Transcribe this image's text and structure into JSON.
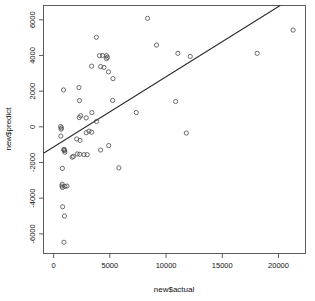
{
  "chart_data": {
    "type": "scatter",
    "title": "",
    "xlabel": "new$actual",
    "ylabel": "new$predict",
    "xlim": [
      -900,
      22400
    ],
    "ylim": [
      -7100,
      6800
    ],
    "grid": false,
    "legend": "none",
    "xticks": [
      0,
      5000,
      10000,
      15000,
      20000
    ],
    "xtick_labels": [
      "0",
      "5000",
      "10000",
      "15000",
      "20000"
    ],
    "yticks": [
      -6000,
      -4000,
      -2000,
      0,
      2000,
      4000,
      6000
    ],
    "ytick_labels": [
      "-6000",
      "-4000",
      "-2000",
      "0",
      "2000",
      "4000",
      "6000"
    ],
    "marker": "open-circle",
    "marker_size": 2.1,
    "point_color": "#4a4a4a",
    "line_color": "#2b2b2b",
    "fit_line": {
      "type": "linear-regression",
      "x_start": -900,
      "y_start": -1480,
      "x_end": 20150,
      "y_end": 6800,
      "slope": 0.3933,
      "intercept": -1126
    },
    "points": [
      {
        "x": 8350,
        "y": 6080
      },
      {
        "x": 21300,
        "y": 5420
      },
      {
        "x": 3800,
        "y": 5020
      },
      {
        "x": 9150,
        "y": 4580
      },
      {
        "x": 11050,
        "y": 4120
      },
      {
        "x": 18100,
        "y": 4120
      },
      {
        "x": 12150,
        "y": 3950
      },
      {
        "x": 4700,
        "y": 3990
      },
      {
        "x": 4780,
        "y": 3900
      },
      {
        "x": 4350,
        "y": 4000
      },
      {
        "x": 4700,
        "y": 3820
      },
      {
        "x": 4080,
        "y": 3990
      },
      {
        "x": 3380,
        "y": 3400
      },
      {
        "x": 4180,
        "y": 3380
      },
      {
        "x": 4480,
        "y": 3330
      },
      {
        "x": 4880,
        "y": 3080
      },
      {
        "x": 5280,
        "y": 2700
      },
      {
        "x": 2250,
        "y": 2200
      },
      {
        "x": 880,
        "y": 2070
      },
      {
        "x": 2300,
        "y": 1470
      },
      {
        "x": 5250,
        "y": 1480
      },
      {
        "x": 10850,
        "y": 1420
      },
      {
        "x": 3400,
        "y": 800
      },
      {
        "x": 7350,
        "y": 800
      },
      {
        "x": 2400,
        "y": 620
      },
      {
        "x": 2900,
        "y": 500
      },
      {
        "x": 2280,
        "y": 520
      },
      {
        "x": 3820,
        "y": 300
      },
      {
        "x": 620,
        "y": 20
      },
      {
        "x": 700,
        "y": -60
      },
      {
        "x": 660,
        "y": -130
      },
      {
        "x": 3150,
        "y": -240
      },
      {
        "x": 3380,
        "y": -300
      },
      {
        "x": 2900,
        "y": -330
      },
      {
        "x": 11800,
        "y": -350
      },
      {
        "x": 640,
        "y": -520
      },
      {
        "x": 2050,
        "y": -680
      },
      {
        "x": 2350,
        "y": -760
      },
      {
        "x": 4900,
        "y": -1050
      },
      {
        "x": 4180,
        "y": -1300
      },
      {
        "x": 940,
        "y": -1260
      },
      {
        "x": 900,
        "y": -1300
      },
      {
        "x": 980,
        "y": -1330
      },
      {
        "x": 1000,
        "y": -1420
      },
      {
        "x": 1750,
        "y": -1660
      },
      {
        "x": 1650,
        "y": -1700
      },
      {
        "x": 2100,
        "y": -1520
      },
      {
        "x": 2320,
        "y": -1540
      },
      {
        "x": 2700,
        "y": -1560
      },
      {
        "x": 2980,
        "y": -1560
      },
      {
        "x": 780,
        "y": -2330
      },
      {
        "x": 5800,
        "y": -2300
      },
      {
        "x": 760,
        "y": -3220
      },
      {
        "x": 740,
        "y": -3320
      },
      {
        "x": 790,
        "y": -3400
      },
      {
        "x": 1000,
        "y": -3340
      },
      {
        "x": 1180,
        "y": -3320
      },
      {
        "x": 800,
        "y": -4480
      },
      {
        "x": 960,
        "y": -5000
      },
      {
        "x": 920,
        "y": -6470
      }
    ]
  }
}
